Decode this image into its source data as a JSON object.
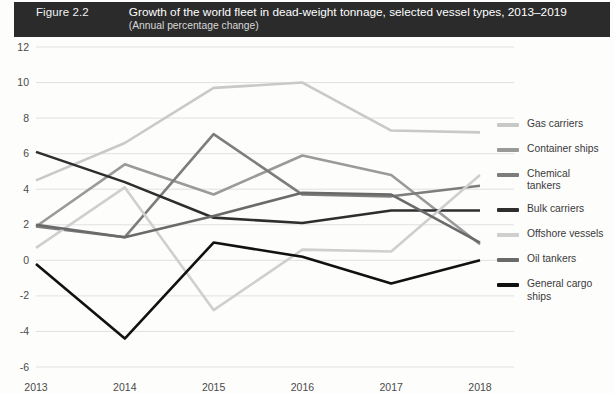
{
  "header": {
    "figure_label": "Figure 2.2",
    "title": "Growth of the world fleet in dead-weight tonnage, selected vessel types, 2013–2019",
    "subtitle": "(Annual percentage change)",
    "bar_color": "#2b2b2b"
  },
  "chart_data": {
    "type": "line",
    "title": "Growth of the world fleet in dead-weight tonnage, selected vessel types, 2013–2019",
    "subtitle": "(Annual percentage change)",
    "xlabel": "",
    "ylabel": "",
    "categories": [
      "2013",
      "2014",
      "2015",
      "2016",
      "2017",
      "2018"
    ],
    "x_tick_labels": [
      "2013",
      "2014",
      "2015",
      "2016",
      "2017",
      "2018"
    ],
    "y_tick_labels": [
      "12",
      "10",
      "8",
      "6",
      "4",
      "2",
      "0",
      "-2",
      "-4",
      "-6"
    ],
    "y_ticks": [
      12,
      10,
      8,
      6,
      4,
      2,
      0,
      -2,
      -4,
      -6
    ],
    "ylim": [
      -6,
      12
    ],
    "grid": true,
    "legend_position": "right",
    "series": [
      {
        "name": "Gas carriers",
        "color": "#c9c9c9",
        "values": [
          4.5,
          6.6,
          9.7,
          10.0,
          7.3,
          7.2
        ]
      },
      {
        "name": "Container ships",
        "color": "#9a9a9a",
        "values": [
          1.9,
          5.4,
          3.7,
          5.9,
          4.8,
          0.9
        ]
      },
      {
        "name": "Chemical\ntankers",
        "color": "#7d7d7d",
        "values": [
          1.9,
          1.3,
          7.1,
          3.7,
          3.6,
          4.2
        ]
      },
      {
        "name": "Bulk carriers",
        "color": "#2e2e2e",
        "values": [
          6.1,
          4.4,
          2.4,
          2.1,
          2.8,
          2.8
        ]
      },
      {
        "name": "Offshore vessels",
        "color": "#cfcfcf",
        "values": [
          0.7,
          4.1,
          -2.8,
          0.6,
          0.5,
          4.8
        ]
      },
      {
        "name": "Oil tankers",
        "color": "#6a6a6a",
        "values": [
          2.0,
          1.3,
          2.5,
          3.8,
          3.7,
          1.0
        ]
      },
      {
        "name": "General cargo\nships",
        "color": "#111111",
        "values": [
          -0.2,
          -4.4,
          1.0,
          0.2,
          -1.3,
          0.0
        ]
      }
    ]
  },
  "legend": {
    "items": [
      {
        "label": "Gas carriers",
        "color": "#c9c9c9"
      },
      {
        "label": "Container ships",
        "color": "#9a9a9a"
      },
      {
        "label": "Chemical\ntankers",
        "color": "#7d7d7d"
      },
      {
        "label": "Bulk carriers",
        "color": "#2e2e2e"
      },
      {
        "label": "Offshore vessels",
        "color": "#cfcfcf"
      },
      {
        "label": "Oil tankers",
        "color": "#6a6a6a"
      },
      {
        "label": "General cargo\nships",
        "color": "#111111"
      }
    ]
  }
}
